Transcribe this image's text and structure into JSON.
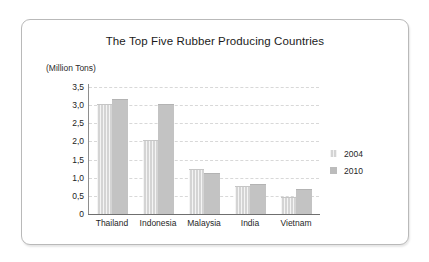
{
  "chart_data": {
    "type": "bar",
    "title": "The Top Five Rubber Producing Countries",
    "xlabel": "",
    "ylabel": "(Million Tons)",
    "categories": [
      "Thailand",
      "Indonesia",
      "Malaysia",
      "India",
      "Vietnam"
    ],
    "series": [
      {
        "name": "2004",
        "values": [
          3.0,
          2.0,
          1.2,
          0.75,
          0.45
        ],
        "color": "#d4d4d4"
      },
      {
        "name": "2010",
        "values": [
          3.15,
          3.0,
          1.1,
          0.8,
          0.65
        ],
        "color": "#c3c3c3"
      }
    ],
    "ylim": [
      0,
      3.5
    ],
    "yticks": [
      0,
      0.5,
      1.0,
      1.5,
      2.0,
      2.5,
      3.0,
      3.5
    ],
    "ytick_labels": [
      "0",
      "0,5",
      "1,0",
      "1,5",
      "2,0",
      "2,5",
      "3,0",
      "3,5"
    ],
    "grid": true,
    "legend_position": "right"
  },
  "legend": {
    "items": [
      {
        "label": "2004"
      },
      {
        "label": "2010"
      }
    ]
  }
}
